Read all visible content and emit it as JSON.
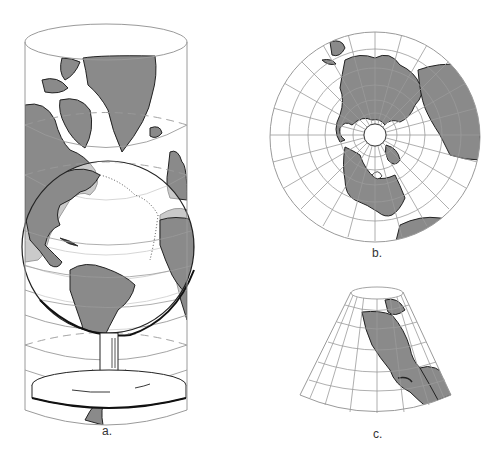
{
  "figure": {
    "panels": [
      {
        "id": "a",
        "label": "a.",
        "projection": "cylindrical",
        "description": "Globe on stand enclosed in a cylinder with continents projected onto it"
      },
      {
        "id": "b",
        "label": "b.",
        "projection": "azimuthal",
        "description": "Polar azimuthal projection centered on North Pole"
      },
      {
        "id": "c",
        "label": "c.",
        "projection": "conic",
        "description": "Conic projection showing North America"
      }
    ]
  },
  "colors": {
    "land": "#8a8a8a",
    "outline": "#222222",
    "grid": "#9a9a9a",
    "background": "#ffffff"
  }
}
